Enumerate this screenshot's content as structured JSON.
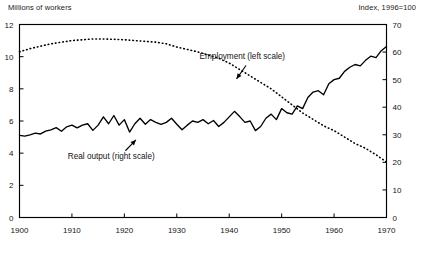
{
  "chart_data": {
    "type": "line",
    "title": "",
    "xlabel": "",
    "left_axis_caption": "Millions of workers",
    "right_axis_caption": "Index, 1996=100",
    "xlim": [
      1900,
      1970
    ],
    "xticks": [
      1900,
      1910,
      1920,
      1930,
      1940,
      1950,
      1960,
      1970
    ],
    "xtick_labels": [
      "1900",
      "1910",
      "1920",
      "1930",
      "1940",
      "1950",
      "1960",
      "1970"
    ],
    "left_ylim": [
      0,
      12
    ],
    "left_yticks": [
      0,
      2,
      4,
      6,
      8,
      10,
      12
    ],
    "left_ytick_labels": [
      "0",
      "2",
      "4",
      "6",
      "8",
      "10",
      "12"
    ],
    "right_ylim": [
      0,
      70
    ],
    "right_yticks": [
      0,
      10,
      20,
      30,
      40,
      50,
      60,
      70
    ],
    "right_ytick_labels": [
      "0",
      "10",
      "20",
      "30",
      "40",
      "50",
      "60",
      "70"
    ],
    "grid": false,
    "legend_position": "inline-annotations",
    "annotations": [
      {
        "name": "employment-annotation",
        "text": "Employment (left scale)",
        "label_x": 1942.5,
        "label_y_left": 9.85,
        "arrow_from": [
          1943.2,
          9.45
        ],
        "arrow_to": [
          1941.4,
          8.62
        ]
      },
      {
        "name": "real-output-annotation",
        "text": "Real output (right scale)",
        "label_x": 1917.5,
        "label_y_left": 3.62,
        "arrow_from": [
          1920.2,
          4.15
        ],
        "arrow_to": [
          1922.2,
          4.82
        ]
      }
    ],
    "series": [
      {
        "name": "Employment (left scale)",
        "label": "Employment (left scale)",
        "axis": "left",
        "style": "dotted",
        "units": "Millions of workers",
        "x": [
          1900,
          1902,
          1904,
          1906,
          1908,
          1910,
          1912,
          1914,
          1916,
          1918,
          1920,
          1922,
          1924,
          1926,
          1928,
          1930,
          1932,
          1934,
          1936,
          1938,
          1940,
          1942,
          1944,
          1946,
          1948,
          1950,
          1952,
          1954,
          1956,
          1958,
          1960,
          1962,
          1964,
          1966,
          1968,
          1970
        ],
        "values": [
          10.3,
          10.5,
          10.65,
          10.8,
          10.9,
          11.0,
          11.05,
          11.1,
          11.1,
          11.08,
          11.05,
          11.0,
          10.95,
          10.9,
          10.8,
          10.6,
          10.45,
          10.3,
          10.1,
          9.9,
          9.6,
          9.2,
          8.8,
          8.4,
          8.0,
          7.5,
          7.0,
          6.5,
          6.1,
          5.7,
          5.4,
          5.0,
          4.6,
          4.3,
          3.9,
          3.45
        ]
      },
      {
        "name": "Real output (right scale)",
        "label": "Real output (right scale)",
        "axis": "right",
        "style": "solid",
        "units": "Index, 1996=100",
        "x": [
          1900,
          1901,
          1902,
          1903,
          1904,
          1905,
          1906,
          1907,
          1908,
          1909,
          1910,
          1911,
          1912,
          1913,
          1914,
          1915,
          1916,
          1917,
          1918,
          1919,
          1920,
          1921,
          1922,
          1923,
          1924,
          1925,
          1926,
          1927,
          1928,
          1929,
          1930,
          1931,
          1932,
          1933,
          1934,
          1935,
          1936,
          1937,
          1938,
          1939,
          1940,
          1941,
          1942,
          1943,
          1944,
          1945,
          1946,
          1947,
          1948,
          1949,
          1950,
          1951,
          1952,
          1953,
          1954,
          1955,
          1956,
          1957,
          1958,
          1959,
          1960,
          1961,
          1962,
          1963,
          1964,
          1965,
          1966,
          1967,
          1968,
          1969,
          1970
        ],
        "values": [
          29.8,
          29.5,
          30.0,
          30.6,
          30.3,
          31.3,
          31.8,
          32.6,
          31.3,
          32.9,
          33.5,
          32.5,
          33.5,
          34.0,
          31.6,
          33.5,
          36.5,
          34.0,
          37.0,
          33.5,
          35.5,
          31.0,
          34.0,
          36.0,
          33.8,
          35.5,
          34.5,
          33.8,
          34.5,
          36.0,
          33.8,
          31.8,
          33.5,
          35.0,
          34.5,
          35.5,
          34.0,
          35.2,
          33.0,
          34.5,
          36.5,
          38.5,
          36.6,
          34.5,
          35.0,
          31.5,
          33.0,
          36.0,
          37.5,
          35.5,
          39.5,
          38.0,
          37.5,
          40.5,
          39.5,
          43.5,
          45.5,
          46.0,
          44.5,
          48.5,
          50.0,
          50.5,
          53.0,
          54.5,
          55.5,
          55.0,
          57.0,
          58.5,
          58.0,
          60.5,
          62.0
        ]
      }
    ]
  }
}
